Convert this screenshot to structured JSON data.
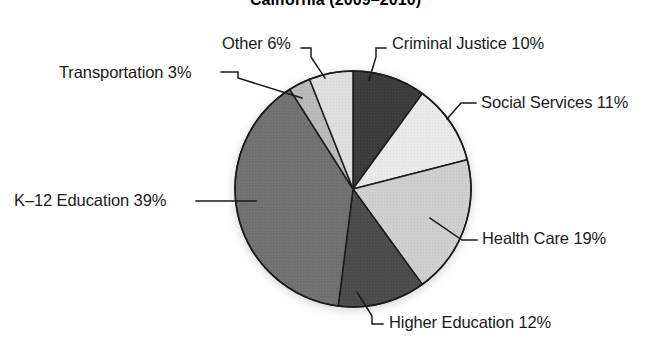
{
  "chart_data": {
    "type": "pie",
    "title": "California (2009–2010)",
    "xlabel": "",
    "ylabel": "",
    "legend_position": "none",
    "grid": false,
    "units": "percent",
    "start_angle_deg": 0,
    "direction": "clockwise",
    "categories": [
      "Criminal Justice",
      "Social Services",
      "Health Care",
      "Higher Education",
      "K–12 Education",
      "Transportation",
      "Other"
    ],
    "values": [
      10,
      11,
      19,
      12,
      39,
      3,
      6
    ],
    "slices": [
      {
        "name": "Criminal Justice",
        "value": 10,
        "label": "Criminal Justice 10%",
        "color": "#3b3b3b",
        "start_deg": 0,
        "end_deg": 36
      },
      {
        "name": "Social Services",
        "value": 11,
        "label": "Social Services 11%",
        "color": "#e9e9e9",
        "start_deg": 36,
        "end_deg": 75.6
      },
      {
        "name": "Health Care",
        "value": 19,
        "label": "Health Care 19%",
        "color": "#cfcfcf",
        "start_deg": 75.6,
        "end_deg": 144
      },
      {
        "name": "Higher Education",
        "value": 12,
        "label": "Higher Education 12%",
        "color": "#4c4c4c",
        "start_deg": 144,
        "end_deg": 187.2
      },
      {
        "name": "K–12 Education",
        "value": 39,
        "label": "K–12 Education 39%",
        "color": "#717171",
        "start_deg": 187.2,
        "end_deg": 327.6
      },
      {
        "name": "Transportation",
        "value": 3,
        "label": "Transportation 3%",
        "color": "#b9b9b9",
        "start_deg": 327.6,
        "end_deg": 338.4
      },
      {
        "name": "Other",
        "value": 6,
        "label": "Other 6%",
        "color": "#dedede",
        "start_deg": 338.4,
        "end_deg": 360
      }
    ]
  },
  "labels": {
    "criminal_justice": "Criminal Justice 10%",
    "social_services": "Social Services 11%",
    "health_care": "Health Care 19%",
    "higher_education": "Higher Education 12%",
    "k12_education": "K–12 Education 39%",
    "transportation": "Transportation 3%",
    "other": "Other 6%"
  },
  "title": "California (2009–2010)",
  "colors": {
    "criminal_justice": "#3b3b3b",
    "social_services": "#e9e9e9",
    "health_care": "#cfcfcf",
    "higher_education": "#4c4c4c",
    "k12_education": "#717171",
    "transportation": "#b9b9b9",
    "other": "#dedede",
    "outline": "#1a1a1a",
    "leader_line": "#1a1a1a",
    "text": "#1a1a1a",
    "background": "#ffffff"
  }
}
